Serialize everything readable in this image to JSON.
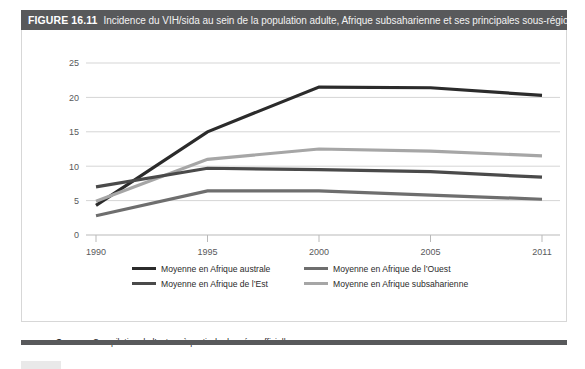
{
  "header": {
    "figure_number": "FIGURE 16.11",
    "caption": "Incidence du VIH/sida au sein de la population adulte, Afrique subsaharienne et ses principales sous-régions",
    "bar_color": "#58595b"
  },
  "source": {
    "label": "Source :",
    "text": " Compilation de l’auteur à partir de données officielles."
  },
  "legend": {
    "items": [
      {
        "label": "Moyenne en Afrique australe",
        "color": "#2b2b2b"
      },
      {
        "label": "Moyenne en Afrique de l’Ouest",
        "color": "#6e6e6e"
      },
      {
        "label": "Moyenne en Afrique de l’Est",
        "color": "#4a4a4a"
      },
      {
        "label": "Moyenne en Afrique subsaharienne",
        "color": "#a6a6a6"
      }
    ]
  },
  "chart_data": {
    "type": "line",
    "title": "Incidence du VIH/sida au sein de la population adulte, Afrique subsaharienne et ses principales sous-régions",
    "xlabel": "",
    "ylabel": "",
    "x": [
      "1990",
      "1995",
      "2000",
      "2005",
      "2011"
    ],
    "categories": [
      "1990",
      "1995",
      "2000",
      "2005",
      "2011"
    ],
    "xtick_labels": [
      "1990",
      "1995",
      "2000",
      "2005",
      "2011"
    ],
    "ytick_labels": [
      "0",
      "5",
      "10",
      "15",
      "20",
      "25"
    ],
    "yticks": [
      0,
      5,
      10,
      15,
      20,
      25
    ],
    "ylim": [
      0,
      25
    ],
    "grid": "horizontal",
    "legend_position": "bottom",
    "series": [
      {
        "name": "Moyenne en Afrique australe",
        "color": "#2b2b2b",
        "values": [
          4.3,
          15.0,
          21.5,
          21.4,
          20.3
        ]
      },
      {
        "name": "Moyenne en Afrique subsaharienne",
        "color": "#a6a6a6",
        "values": [
          4.9,
          11.0,
          12.5,
          12.2,
          11.5
        ]
      },
      {
        "name": "Moyenne en Afrique de l’Est",
        "color": "#4a4a4a",
        "values": [
          7.0,
          9.7,
          9.5,
          9.2,
          8.4
        ]
      },
      {
        "name": "Moyenne en Afrique de l’Ouest",
        "color": "#6e6e6e",
        "values": [
          2.8,
          6.4,
          6.4,
          5.8,
          5.2
        ]
      }
    ]
  }
}
